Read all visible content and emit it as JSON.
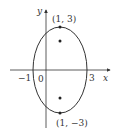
{
  "diagram": {
    "type": "ellipse-graph",
    "axes": {
      "x_label": "x",
      "y_label": "y"
    },
    "ticks": {
      "x_neg": "−1",
      "origin": "0",
      "x_pos": "3"
    },
    "points": [
      {
        "label": "(1, 3)",
        "role": "vertex-top"
      },
      {
        "label": "(1, −3)",
        "role": "vertex-bottom"
      }
    ],
    "foci_count": 2,
    "colors": {
      "stroke": "#333333",
      "background": "#ffffff"
    }
  }
}
